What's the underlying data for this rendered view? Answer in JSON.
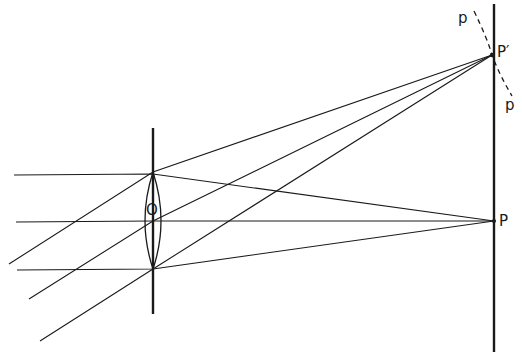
{
  "diagram": {
    "type": "optics-ray-diagram",
    "colors": {
      "background": "#ffffff",
      "ink": "#1a1a1a"
    },
    "labels": {
      "lens_center": "O",
      "axial_focus": "P",
      "offaxis_focus": "P′",
      "curve_top": "p",
      "curve_bottom": "p"
    },
    "lens": {
      "x": 153,
      "axis_top": 128,
      "axis_bottom": 314,
      "vertex_top": 172,
      "vertex_bottom": 269,
      "half_width": 12,
      "center_y": 221
    },
    "screen": {
      "x": 494,
      "top": 4,
      "bottom": 352
    },
    "focus_points": {
      "P": {
        "x": 494,
        "y": 221
      },
      "P_prime": {
        "x": 492,
        "y": 55
      }
    },
    "parallel_rays": [
      {
        "start": [
          14,
          175
        ],
        "lens_hit": [
          153,
          175
        ]
      },
      {
        "start": [
          16,
          222
        ],
        "lens_hit": [
          153,
          222
        ]
      },
      {
        "start": [
          17,
          270
        ],
        "lens_hit": [
          153,
          270
        ]
      }
    ],
    "oblique_rays": [
      {
        "start": [
          9,
          264
        ],
        "lens_hit": [
          153,
          172
        ]
      },
      {
        "start": [
          29,
          299
        ],
        "lens_hit": [
          153,
          221
        ]
      },
      {
        "start": [
          40,
          341
        ],
        "lens_hit": [
          153,
          269
        ]
      }
    ]
  }
}
